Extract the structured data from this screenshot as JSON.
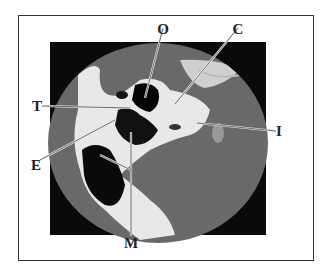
{
  "figure": {
    "type": "labeled CT scan (axial), circular field of view",
    "labels": [
      {
        "id": "O",
        "text": "O",
        "x": 163,
        "y": 22
      },
      {
        "id": "C",
        "text": "C",
        "x": 238,
        "y": 22
      },
      {
        "id": "T",
        "text": "T",
        "x": 32,
        "y": 101
      },
      {
        "id": "I",
        "text": "I",
        "x": 276,
        "y": 124
      },
      {
        "id": "E",
        "text": "E",
        "x": 31,
        "y": 158
      },
      {
        "id": "M",
        "text": "M",
        "x": 122,
        "y": 236
      }
    ]
  }
}
